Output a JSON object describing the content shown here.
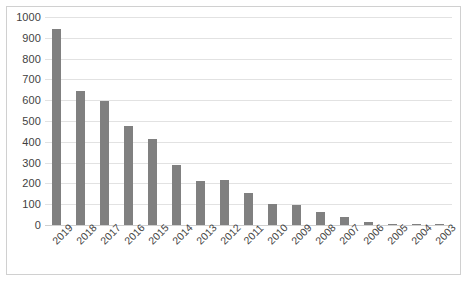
{
  "chart_data": {
    "type": "bar",
    "title": "",
    "subtitle": "",
    "xlabel": "",
    "ylabel": "",
    "grid": true,
    "legend": false,
    "orientation": "vertical",
    "bar_color": "#808080",
    "gridline_color": "#e2e2e2",
    "plot_background": "#ffffff",
    "border_color": "#d0d0d0",
    "ylim": [
      0,
      1000
    ],
    "ytick_interval": 100,
    "ytick_labels": [
      "1000",
      "900",
      "800",
      "700",
      "600",
      "500",
      "400",
      "300",
      "200",
      "100",
      "0"
    ],
    "ytick_values": [
      1000,
      900,
      800,
      700,
      600,
      500,
      400,
      300,
      200,
      100,
      0
    ],
    "categories": [
      "2019",
      "2018",
      "2017",
      "2016",
      "2015",
      "2014",
      "2013",
      "2012",
      "2011",
      "2010",
      "2009",
      "2008",
      "2007",
      "2006",
      "2005",
      "2004",
      "2003"
    ],
    "values": [
      940,
      645,
      598,
      475,
      413,
      287,
      212,
      215,
      155,
      100,
      95,
      62,
      38,
      13,
      7,
      5,
      2
    ],
    "xtick_rotation": -45
  }
}
